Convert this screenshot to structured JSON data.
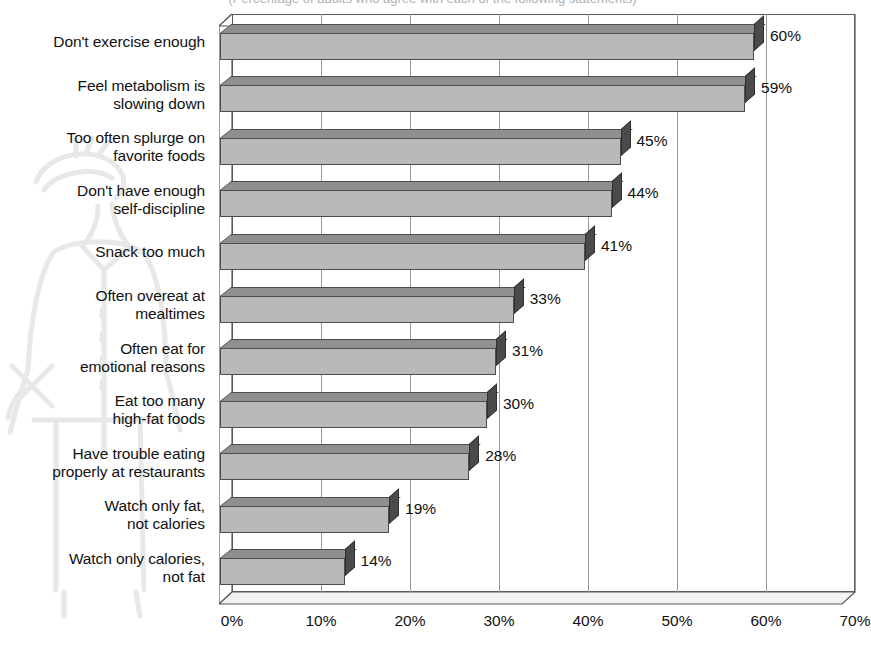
{
  "title": {
    "text": "(Percentage of adults who agree with each of the following statements)",
    "clipped": true
  },
  "watermark": {
    "name": "sketch-figure-watermark"
  },
  "chart_data": {
    "type": "bar",
    "orientation": "horizontal",
    "style": "3d",
    "title": "(Percentage of adults who agree with each of the following statements)",
    "xlabel": "",
    "ylabel": "",
    "xlim": [
      0,
      70
    ],
    "xticks": [
      "0%",
      "10%",
      "20%",
      "30%",
      "40%",
      "50%",
      "60%",
      "70%"
    ],
    "xtick_values": [
      0,
      10,
      20,
      30,
      40,
      50,
      60,
      70
    ],
    "grid": "vertical",
    "legend": "none",
    "value_suffix": "%",
    "categories": [
      "Don't exercise enough",
      "Feel metabolism is slowing down",
      "Too often splurge on favorite foods",
      "Don't have enough self-discipline",
      "Snack too much",
      "Often overeat at mealtimes",
      "Often eat for emotional reasons",
      "Eat too many high-fat foods",
      "Have trouble eating properly at restaurants",
      "Watch only fat, not calories",
      "Watch only calories, not fat"
    ],
    "category_lines": [
      [
        "Don't exercise enough"
      ],
      [
        "Feel metabolism is",
        "slowing down"
      ],
      [
        "Too often splurge on",
        "favorite foods"
      ],
      [
        "Don't have enough",
        "self-discipline"
      ],
      [
        "Snack too much"
      ],
      [
        "Often overeat at",
        "mealtimes"
      ],
      [
        "Often eat for",
        "emotional reasons"
      ],
      [
        "Eat too many",
        "high-fat foods"
      ],
      [
        "Have trouble eating",
        "properly at restaurants"
      ],
      [
        "Watch only fat,",
        "not calories"
      ],
      [
        "Watch only calories,",
        "not fat"
      ]
    ],
    "values": [
      60,
      59,
      45,
      44,
      41,
      33,
      31,
      30,
      28,
      19,
      14
    ],
    "value_labels": [
      "60%",
      "59%",
      "45%",
      "44%",
      "41%",
      "33%",
      "31%",
      "30%",
      "28%",
      "19%",
      "14%"
    ]
  },
  "colors": {
    "bar_front": "#b9b9b9",
    "bar_top": "#8f8f8f",
    "bar_side": "#4a4a4a",
    "outline": "#4d4d4d",
    "grid": "#9a9a9a",
    "axis": "#5a5a5a",
    "text": "#111111",
    "background": "#ffffff"
  }
}
